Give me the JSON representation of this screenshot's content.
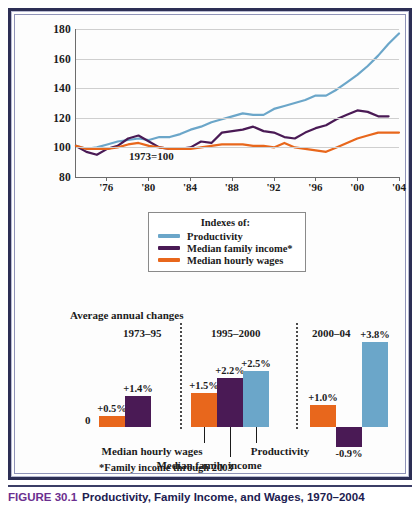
{
  "caption": {
    "figure_number": "FIGURE 30.1",
    "title": "Productivity, Family Income, and Wages, 1970–2004"
  },
  "colors": {
    "productivity": "#6ba6c9",
    "median_family_income": "#4a1a55",
    "median_hourly_wages": "#e8671c",
    "frame": "#2d2f55",
    "caption_text": "#1d2050",
    "caption_number": "#6b2f8f",
    "gridline": "#cfcfcf",
    "axis": "#6c6c6c"
  },
  "legend": {
    "title": "Indexes of:",
    "items": [
      {
        "label": "Productivity",
        "color": "#6ba6c9"
      },
      {
        "label": "Median family income*",
        "color": "#4a1a55"
      },
      {
        "label": "Median hourly wages",
        "color": "#e8671c"
      }
    ]
  },
  "line_chart_annotation": "1973=100",
  "bar_chart": {
    "title": "Average annual changes",
    "zero_label": "0",
    "footnote": "*Family income through 2003",
    "group_headers": [
      "1973–95",
      "1995–2000",
      "2000–04"
    ],
    "series_names": [
      "Median hourly wages",
      "Median family income",
      "Productivity"
    ],
    "value_labels": [
      "+0.5%",
      "+1.4%",
      "+1.5%",
      "+2.2%",
      "+2.5%",
      "+1.0%",
      "-0.9%",
      "+3.8%"
    ]
  },
  "chart_data": [
    {
      "type": "line",
      "title": "Productivity, Family Income, and Wages, 1970–2004",
      "xlabel": "",
      "ylabel": "Index (1973=100)",
      "annotation": "1973=100",
      "grid": true,
      "legend_position": "below-center",
      "ylim": [
        80,
        180
      ],
      "yticks": [
        80,
        100,
        120,
        140,
        160,
        180
      ],
      "xlim": [
        1973,
        2004
      ],
      "xticks": [
        1976,
        1980,
        1984,
        1988,
        1992,
        1996,
        2000,
        2004
      ],
      "xticklabels": [
        "'76",
        "'80",
        "'84",
        "'88",
        "'92",
        "'96",
        "'00",
        "'04"
      ],
      "x": [
        1973,
        1974,
        1975,
        1976,
        1977,
        1978,
        1979,
        1980,
        1981,
        1982,
        1983,
        1984,
        1985,
        1986,
        1987,
        1988,
        1989,
        1990,
        1991,
        1992,
        1993,
        1994,
        1995,
        1996,
        1997,
        1998,
        1999,
        2000,
        2001,
        2002,
        2003,
        2004
      ],
      "series": [
        {
          "name": "Productivity",
          "color": "#6ba6c9",
          "values": [
            101,
            99,
            100,
            102,
            104,
            105,
            106,
            105,
            107,
            107,
            109,
            112,
            114,
            117,
            119,
            121,
            123,
            122,
            122,
            126,
            128,
            130,
            132,
            135,
            135,
            139,
            144,
            149,
            155,
            162,
            170,
            177
          ]
        },
        {
          "name": "Median family income*",
          "color": "#4a1a55",
          "values": [
            101,
            97,
            95,
            99,
            101,
            106,
            108,
            104,
            100,
            99,
            99,
            100,
            104,
            103,
            110,
            111,
            112,
            114,
            111,
            110,
            107,
            106,
            110,
            113,
            115,
            119,
            122,
            125,
            124,
            121,
            121,
            null
          ]
        },
        {
          "name": "Median hourly wages",
          "color": "#e8671c",
          "values": [
            101,
            99,
            99,
            99,
            100,
            102,
            103,
            101,
            100,
            99,
            99,
            99,
            100,
            101,
            102,
            102,
            102,
            101,
            101,
            100,
            103,
            100,
            99,
            98,
            97,
            100,
            103,
            106,
            108,
            110,
            110,
            110
          ]
        }
      ]
    },
    {
      "type": "bar",
      "title": "Average annual changes",
      "ylabel": "Average annual change (%)",
      "xlabel": "",
      "grid": false,
      "zero_line": 0,
      "ylim": [
        -1.4,
        4.2
      ],
      "groups": [
        "1973–95",
        "1995–2000",
        "2000–04"
      ],
      "categories": [
        "Median hourly wages",
        "Median family income",
        "Productivity"
      ],
      "series": [
        {
          "name": "Median hourly wages",
          "color": "#e8671c",
          "values": [
            0.5,
            1.5,
            1.0
          ]
        },
        {
          "name": "Median family income",
          "color": "#4a1a55",
          "values": [
            1.4,
            2.2,
            -0.9
          ]
        },
        {
          "name": "Productivity",
          "color": "#6ba6c9",
          "values": [
            null,
            2.5,
            3.8
          ]
        }
      ],
      "bars": [
        {
          "group": "1973–95",
          "series": "Median hourly wages",
          "value": 0.5,
          "label": "+0.5%"
        },
        {
          "group": "1973–95",
          "series": "Median family income",
          "value": 1.4,
          "label": "+1.4%"
        },
        {
          "group": "1995–2000",
          "series": "Median hourly wages",
          "value": 1.5,
          "label": "+1.5%"
        },
        {
          "group": "1995–2000",
          "series": "Median family income",
          "value": 2.2,
          "label": "+2.2%"
        },
        {
          "group": "1995–2000",
          "series": "Productivity",
          "value": 2.5,
          "label": "+2.5%"
        },
        {
          "group": "2000–04",
          "series": "Median hourly wages",
          "value": 1.0,
          "label": "+1.0%"
        },
        {
          "group": "2000–04",
          "series": "Median family income",
          "value": -0.9,
          "label": "-0.9%"
        },
        {
          "group": "2000–04",
          "series": "Productivity",
          "value": 3.8,
          "label": "+3.8%"
        }
      ],
      "footnote": "*Family income through 2003"
    }
  ]
}
